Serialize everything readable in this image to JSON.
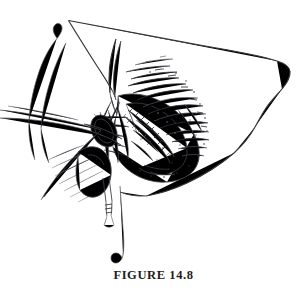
{
  "figure": {
    "caption": "FIGURE 14.8",
    "alt_description": "Black and white line drawing of a surgical field: a large rounded tissue flap is retracted upward and to the right, exposing a deep incision with stippled and hatched shading at the left; several fine retractor and suture threads cross the field from the left, a needle holder grasps a suture whose long tail hangs down and curls at its free end.",
    "style": "pen-and-ink line illustration",
    "background_color": "#ffffff",
    "ink_color": "#3b3b3f"
  },
  "elements": {
    "tissue_flap_label": "retracted tissue flap",
    "incision_label": "sutured incision line",
    "suture_tail_label": "hanging suture tail",
    "instrument_label": "needle holder",
    "retractor_threads_label": "retractor threads"
  }
}
